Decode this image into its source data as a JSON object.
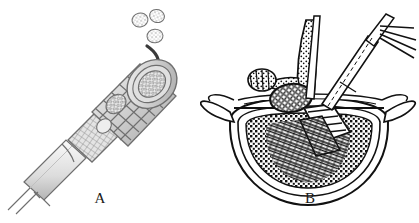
{
  "figure": {
    "background_color": "#ffffff",
    "panels": [
      {
        "id": "A",
        "caption": "A",
        "description": "Threaded interbody fusion cage on an inserter handle being packed with morselized bone graft",
        "ink_color": "#6f6f6f",
        "elements": {
          "graft_chips_label": "bone graft chips",
          "arrow_label": "packing-direction-arrow",
          "cage_label": "threaded cylindrical cage",
          "knurl_label": "knurled grip",
          "shaft_label": "inserter shaft"
        }
      },
      {
        "id": "B",
        "caption": "B",
        "description": "Axial view of a lumbar vertebra with a threaded cage inserted into the vertebral body and instruments in place",
        "ink_color": "#111111",
        "elements": {
          "spinous_label": "spinous process",
          "transverse_left_label": "left transverse process",
          "transverse_right_label": "right transverse process",
          "facet_label": "facet joint",
          "canal_label": "spinal canal contents",
          "body_label": "vertebral body",
          "trabecular_label": "cancellous bone",
          "cage_label": "inserted threaded cage",
          "instrument_label": "retractor instruments"
        }
      }
    ]
  }
}
